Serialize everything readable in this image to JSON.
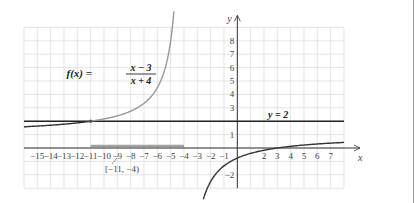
{
  "chart_data": {
    "type": "line",
    "title": "",
    "function_label": "f(x) = (x − 3)/(x + 4)",
    "function": {
      "name": "f(x)",
      "numerator": "x − 3",
      "denominator": "x + 4"
    },
    "asymptote_label": "y = 2",
    "horizontal_asymptote": 2,
    "vertical_asymptote": -4,
    "interval_label": "[−11, −4)",
    "interval": [
      -11,
      -4
    ],
    "xlabel": "x",
    "ylabel": "y",
    "xlim": [
      -16,
      8
    ],
    "ylim": [
      -3,
      9
    ],
    "grid": true,
    "x_ticks": [
      -15,
      -14,
      -13,
      -12,
      -11,
      -10,
      -9,
      -8,
      -7,
      -6,
      -5,
      -4,
      -3,
      -2,
      -1,
      2,
      3,
      4,
      5,
      6,
      7
    ],
    "x_tick_labels": [
      "−15",
      "−14",
      "−13",
      "−12",
      "−11",
      "−10",
      "−9",
      "−8",
      "−7",
      "−6",
      "−5",
      "−4",
      "−3",
      "−2",
      "−1",
      "2",
      "3",
      "4",
      "5",
      "6",
      "7"
    ],
    "y_ticks": [
      8,
      7,
      6,
      5,
      4,
      3,
      1,
      -2
    ],
    "y_tick_labels": [
      "8",
      "7",
      "6",
      "5",
      "4",
      "3",
      "1",
      "−2"
    ],
    "series": [
      {
        "name": "f(x) left branch (x < −4)",
        "x": [
          -16,
          -15,
          -14,
          -13,
          -12,
          -11,
          -10,
          -9,
          -8,
          -7,
          -6,
          -5,
          -4.8
        ],
        "y": [
          1.58,
          1.64,
          1.7,
          1.78,
          1.88,
          2.0,
          2.17,
          2.4,
          2.75,
          3.33,
          4.5,
          8.0,
          9.75
        ]
      },
      {
        "name": "f(x) right branch (x > −4)",
        "x": [
          -3,
          -2,
          -1,
          0,
          1,
          2,
          3,
          4,
          5,
          6,
          7,
          8
        ],
        "y": [
          -6,
          -2.5,
          -1.33,
          -0.75,
          -0.4,
          -0.17,
          0,
          0.13,
          0.22,
          0.3,
          0.36,
          0.42
        ]
      }
    ],
    "highlight_point": {
      "x": -11,
      "y": 2
    }
  },
  "labels": {
    "f": "f(x) =",
    "num": "x − 3",
    "den": "x + 4",
    "asym": "y = 2",
    "interval": "[−11, −4)",
    "xaxis": "x",
    "yaxis": "y"
  }
}
